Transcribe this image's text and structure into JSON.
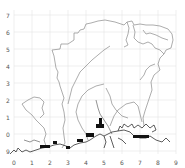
{
  "map": {
    "x_ticks": [
      "0",
      "1",
      "2",
      "3",
      "4",
      "5",
      "6",
      "7",
      "8",
      "9"
    ],
    "y_ticks": [
      "7",
      "6",
      "5",
      "4",
      "3",
      "2",
      "1",
      "0",
      "9"
    ],
    "grid": true,
    "colors": {
      "background": "#ffffff",
      "grid": "#e4e4e4",
      "boundary": "#8a8a8a",
      "coastline": "#333333",
      "highlight": "#111111"
    },
    "highlighted_segments": 8
  }
}
